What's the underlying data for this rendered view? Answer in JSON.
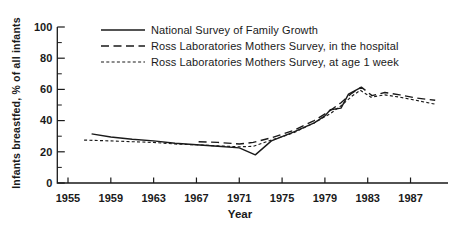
{
  "figure": {
    "background": "#ffffff",
    "ink_color": "#1a1a1a"
  },
  "chart_data": {
    "type": "line",
    "title": "",
    "xlabel": "Year",
    "ylabel": "Infants breastfed, % of all infants",
    "xlim": [
      1954,
      1990.5
    ],
    "ylim": [
      0,
      100
    ],
    "x_ticks": [
      1955,
      1959,
      1963,
      1967,
      1971,
      1975,
      1979,
      1983,
      1987
    ],
    "y_ticks": [
      0,
      20,
      40,
      60,
      80,
      100
    ],
    "y_minor_ticks": [
      10,
      30,
      50,
      70,
      90
    ],
    "grid": false,
    "legend_position": "top-inside",
    "series": [
      {
        "name": "National Survey of Family Growth",
        "style": "solid",
        "points": [
          [
            1957.2,
            31.5
          ],
          [
            1959,
            29.5
          ],
          [
            1961,
            28
          ],
          [
            1963,
            27
          ],
          [
            1965,
            25.5
          ],
          [
            1967,
            24.5
          ],
          [
            1969,
            23.5
          ],
          [
            1971,
            22.5
          ],
          [
            1972.5,
            18
          ],
          [
            1974,
            27
          ],
          [
            1976,
            32.5
          ],
          [
            1978,
            38.5
          ],
          [
            1979,
            43
          ],
          [
            1979.5,
            47
          ],
          [
            1980.5,
            48
          ],
          [
            1981.2,
            57
          ],
          [
            1982.3,
            61
          ]
        ]
      },
      {
        "name": "Ross Laboratories Mothers Survey, in the hospital",
        "style": "long-dash",
        "points": [
          [
            1967.2,
            26.5
          ],
          [
            1969,
            26
          ],
          [
            1971,
            25
          ],
          [
            1972.3,
            26
          ],
          [
            1974,
            29
          ],
          [
            1976,
            33.5
          ],
          [
            1978,
            40
          ],
          [
            1979.5,
            46.5
          ],
          [
            1980.5,
            51.5
          ],
          [
            1981.5,
            57.5
          ],
          [
            1982.4,
            61.5
          ],
          [
            1983.4,
            56
          ],
          [
            1984.6,
            58
          ],
          [
            1986,
            56.5
          ],
          [
            1987.5,
            54.5
          ],
          [
            1989.3,
            53
          ]
        ]
      },
      {
        "name": "Ross Laboratories Mothers Survey, at age 1 week",
        "style": "short-dash",
        "points": [
          [
            1956.5,
            27.5
          ],
          [
            1959,
            27
          ],
          [
            1961,
            26.5
          ],
          [
            1963,
            26
          ],
          [
            1965,
            25
          ],
          [
            1967,
            24.5
          ],
          [
            1969,
            23.8
          ],
          [
            1971,
            23.2
          ],
          [
            1972.3,
            23.5
          ],
          [
            1974,
            27.5
          ],
          [
            1976,
            32
          ],
          [
            1978,
            38.5
          ],
          [
            1979.5,
            44.5
          ],
          [
            1980.5,
            49.5
          ],
          [
            1981.5,
            55.5
          ],
          [
            1982.3,
            59.5
          ],
          [
            1983.3,
            55
          ],
          [
            1984.6,
            56.5
          ],
          [
            1986,
            55
          ],
          [
            1987.5,
            53
          ],
          [
            1989.3,
            50.5
          ]
        ]
      }
    ]
  }
}
